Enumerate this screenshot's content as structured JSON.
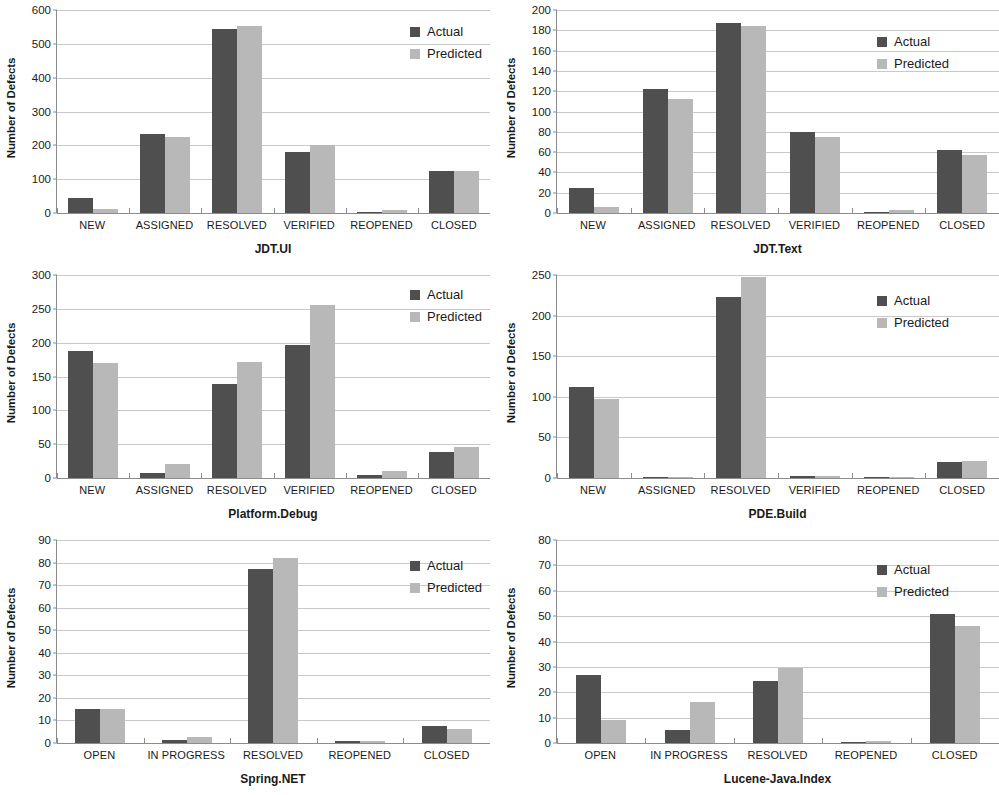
{
  "figure": {
    "series_labels": [
      "Actual",
      "Predicted"
    ],
    "y_axis_title": "Number of Defects",
    "colors": {
      "actual": "#4f4f4f",
      "predicted": "#b8b8b8",
      "gridline": "#c9c9c9",
      "axis": "#8c8c8c",
      "background": "#ffffff"
    }
  },
  "chart_data": [
    {
      "type": "bar",
      "title": "JDT.UI",
      "xlabel": "JDT.UI",
      "ylabel": "Number of Defects",
      "ylim": [
        0,
        600
      ],
      "yticks": [
        0,
        100,
        200,
        300,
        400,
        500,
        600
      ],
      "grid": true,
      "legend_position": "top-right",
      "categories": [
        "NEW",
        "ASSIGNED",
        "RESOLVED",
        "VERIFIED",
        "REOPENED",
        "CLOSED"
      ],
      "series": [
        {
          "name": "Actual",
          "values": [
            45,
            233,
            545,
            181,
            2,
            123
          ]
        },
        {
          "name": "Predicted",
          "values": [
            13,
            225,
            553,
            202,
            9,
            125
          ]
        }
      ]
    },
    {
      "type": "bar",
      "title": "JDT.Text",
      "xlabel": "JDT.Text",
      "ylabel": "Number of Defects",
      "ylim": [
        0,
        200
      ],
      "yticks": [
        0,
        20,
        40,
        60,
        80,
        100,
        120,
        140,
        160,
        180,
        200
      ],
      "grid": true,
      "legend_position": "top-right",
      "categories": [
        "NEW",
        "ASSIGNED",
        "RESOLVED",
        "VERIFIED",
        "REOPENED",
        "CLOSED"
      ],
      "series": [
        {
          "name": "Actual",
          "values": [
            25,
            122,
            187,
            80,
            0,
            62
          ]
        },
        {
          "name": "Predicted",
          "values": [
            6,
            112,
            184,
            75,
            3,
            57
          ]
        }
      ]
    },
    {
      "type": "bar",
      "title": "Platform.Debug",
      "xlabel": "Platform.Debug",
      "ylabel": "Number of Defects",
      "ylim": [
        0,
        300
      ],
      "yticks": [
        0,
        50,
        100,
        150,
        200,
        250,
        300
      ],
      "grid": true,
      "legend_position": "top-right",
      "categories": [
        "NEW",
        "ASSIGNED",
        "RESOLVED",
        "VERIFIED",
        "REOPENED",
        "CLOSED"
      ],
      "series": [
        {
          "name": "Actual",
          "values": [
            187,
            8,
            139,
            196,
            5,
            38
          ]
        },
        {
          "name": "Predicted",
          "values": [
            170,
            20,
            172,
            255,
            10,
            46
          ]
        }
      ]
    },
    {
      "type": "bar",
      "title": "PDE.Build",
      "xlabel": "PDE.Build",
      "ylabel": "Number of Defects",
      "ylim": [
        0,
        250
      ],
      "yticks": [
        0,
        50,
        100,
        150,
        200,
        250
      ],
      "grid": true,
      "legend_position": "top-right",
      "categories": [
        "NEW",
        "ASSIGNED",
        "RESOLVED",
        "VERIFIED",
        "REOPENED",
        "CLOSED"
      ],
      "series": [
        {
          "name": "Actual",
          "values": [
            112,
            1,
            223,
            3,
            0,
            20
          ]
        },
        {
          "name": "Predicted",
          "values": [
            97,
            1,
            247,
            3,
            1,
            21
          ]
        }
      ]
    },
    {
      "type": "bar",
      "title": "Spring.NET",
      "xlabel": "Spring.NET",
      "ylabel": "Number of Defects",
      "ylim": [
        0,
        90
      ],
      "yticks": [
        0,
        10,
        20,
        30,
        40,
        50,
        60,
        70,
        80,
        90
      ],
      "grid": true,
      "legend_position": "top-right",
      "categories": [
        "OPEN",
        "IN PROGRESS",
        "RESOLVED",
        "REOPENED",
        "CLOSED"
      ],
      "series": [
        {
          "name": "Actual",
          "values": [
            15,
            1.5,
            77,
            1,
            7.5
          ]
        },
        {
          "name": "Predicted",
          "values": [
            15,
            2.5,
            82,
            1,
            6
          ]
        }
      ]
    },
    {
      "type": "bar",
      "title": "Lucene-Java.Index",
      "xlabel": "Lucene-Java.Index",
      "ylabel": "Number of Defects",
      "ylim": [
        0,
        80
      ],
      "yticks": [
        0,
        10,
        20,
        30,
        40,
        50,
        60,
        70,
        80
      ],
      "grid": true,
      "legend_position": "top-right",
      "categories": [
        "OPEN",
        "IN PROGRESS",
        "RESOLVED",
        "REOPENED",
        "CLOSED"
      ],
      "series": [
        {
          "name": "Actual",
          "values": [
            27,
            5,
            24.5,
            0,
            51
          ]
        },
        {
          "name": "Predicted",
          "values": [
            9,
            16,
            29.5,
            0.7,
            46
          ]
        }
      ]
    }
  ]
}
